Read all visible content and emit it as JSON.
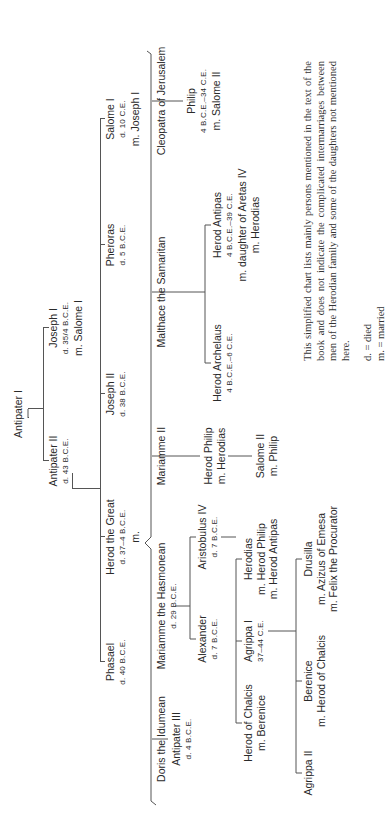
{
  "generation1": {
    "antipater_i": {
      "name": "Antipater I"
    }
  },
  "generation2": {
    "antipater_ii": {
      "name": "Antipater II",
      "info": "d. 43 B.C.E."
    },
    "joseph_i": {
      "name": "Joseph I",
      "info": "d. 35/4 B.C.E.",
      "spouse": "m. Salome I"
    }
  },
  "generation3": {
    "phasael": {
      "name": "Phasael",
      "info": "d. 40 B.C.E."
    },
    "herod_the_great": {
      "name": "Herod the Great",
      "info": "d. 37–4 B.C.E.",
      "spouse": "m."
    },
    "joseph_ii": {
      "name": "Joseph II",
      "info": "d. 38 B.C.E."
    },
    "pheroras": {
      "name": "Pheroras",
      "info": "d. 5 B.C.E."
    },
    "salome_i": {
      "name": "Salome I",
      "info": "d. 10 C.E.",
      "spouse": "m. Joseph I"
    }
  },
  "wives": [
    {
      "name": "Doris the Idumean"
    },
    {
      "name": "Mariamme the Hasmonean",
      "info": "d. 29 B.C.E."
    },
    {
      "name": "Mariamme II"
    },
    {
      "name": "Malthace the Samaritan"
    },
    {
      "name": "Cleopatra of Jerusalem"
    }
  ],
  "children": {
    "antipater_iii": {
      "name": "Antipater III",
      "info": "d. 4 B.C.E."
    },
    "alexander": {
      "name": "Alexander",
      "info": "d. 7 B.C.E."
    },
    "aristobulus_iv": {
      "name": "Aristobulus IV",
      "info": "d. 7 B.C.E."
    },
    "herod_philip": {
      "name": "Herod Philip",
      "spouse": "m. Herodias"
    },
    "herod_archelaus": {
      "name": "Herod Archelaus",
      "info": "4 B.C.E.–6 C.E."
    },
    "herod_antipas": {
      "name": "Herod Antipas",
      "info": "4 B.C.E.–39 C.E.",
      "spouse": "m. daughter of Aretas IV",
      "spouse2": "m. Herodias"
    },
    "philip": {
      "name": "Philip",
      "info": "4 B.C.E.–34 C.E.",
      "spouse": "m. Salome II"
    }
  },
  "grandchildren": {
    "herod_of_chalcis": {
      "name": "Herod of Chalcis",
      "spouse": "m. Berenice"
    },
    "agrippa_i": {
      "name": "Agrippa I",
      "info": "37–44 C.E."
    },
    "herodias": {
      "name": "Herodias",
      "spouse": "m. Herod Philip",
      "spouse2": "m. Herod Antipas"
    },
    "salome_ii": {
      "name": "Salome II",
      "spouse": "m. Philip"
    }
  },
  "great_grandchildren": {
    "agrippa_ii": {
      "name": "Agrippa II"
    },
    "berenice": {
      "name": "Berenice",
      "spouse": "m. Herod of Chalcis"
    },
    "drusilla": {
      "name": "Drusilla",
      "spouse": "m. Azizus of Emesa",
      "spouse2": "m. Felix the Procurator"
    }
  },
  "note": {
    "text": "This simplified chart lists mainly persons mentioned in the text of the book and does not indicate the complicated intermarriages between men of the Herodian family and some of the daughters not mentioned here.",
    "legend_d": "d. = died",
    "legend_m": "m. = married"
  },
  "colors": {
    "line": "#555555",
    "text": "#2a2a2a",
    "background": "#ffffff"
  }
}
